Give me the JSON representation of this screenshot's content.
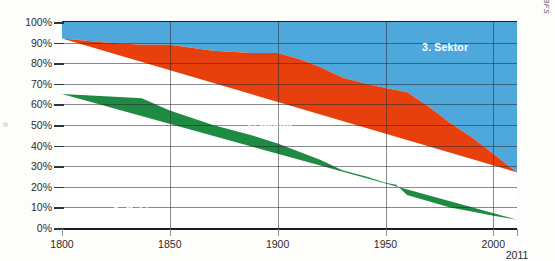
{
  "chart_data": {
    "type": "area",
    "stacked": "100-percent",
    "title": "",
    "subtitle": "",
    "xlabel": "",
    "ylabel": "",
    "xlim": [
      1800,
      2011
    ],
    "ylim": [
      0,
      100
    ],
    "grid": true,
    "legend_position": "inline",
    "source": "Quelle: BFS",
    "xticks": [
      1800,
      1850,
      1900,
      1950,
      2000
    ],
    "xtick_labels": [
      "1800",
      "1850",
      "1900",
      "1950",
      "2000"
    ],
    "x_end_label": "2011",
    "yticks": [
      0,
      10,
      20,
      30,
      40,
      50,
      60,
      70,
      80,
      90,
      100
    ],
    "ytick_labels": [
      "0%",
      "10%",
      "20%",
      "30%",
      "40%",
      "50%",
      "60%",
      "70%",
      "80%",
      "90%",
      "100%"
    ],
    "x": [
      1800,
      1820,
      1837,
      1850,
      1870,
      1888,
      1900,
      1910,
      1920,
      1930,
      1941,
      1950,
      1955,
      1960,
      1970,
      1980,
      1990,
      2000,
      2011
    ],
    "series": [
      {
        "name": "1. Sektor",
        "color": "#1e8a42",
        "values": [
          65,
          64,
          63,
          57,
          50,
          45,
          41,
          37,
          33,
          28,
          25,
          22,
          21,
          16,
          13,
          10,
          8,
          6,
          4
        ]
      },
      {
        "name": "2. Sektor",
        "color": "#e8400c",
        "values": [
          27,
          26,
          26,
          32,
          36,
          40,
          44,
          45,
          45,
          45,
          45,
          46,
          46,
          50,
          46,
          41,
          36,
          30,
          23
        ]
      },
      {
        "name": "3. Sektor",
        "color": "#4fa8dc",
        "values": [
          8,
          10,
          11,
          11,
          14,
          15,
          15,
          18,
          22,
          27,
          30,
          32,
          33,
          34,
          41,
          49,
          56,
          64,
          73
        ]
      }
    ],
    "cumulative_upper_bounds": {
      "sector1_top": [
        65,
        64,
        63,
        57,
        50,
        45,
        41,
        37,
        33,
        28,
        25,
        22,
        21,
        16,
        13,
        10,
        8,
        6,
        4
      ],
      "sector2_top": [
        92,
        90,
        89,
        89,
        86,
        85,
        85,
        82,
        78,
        73,
        70,
        68,
        67,
        66,
        59,
        51,
        44,
        36,
        27
      ]
    },
    "annotations": [
      {
        "text": "1. Sektor",
        "x": 1824,
        "y": 9
      },
      {
        "text": "2. Sektor",
        "x": 1886,
        "y": 51
      },
      {
        "text": "3. Sektor",
        "x": 1967,
        "y": 88
      }
    ]
  },
  "axis": {
    "y_labels": [
      "100%",
      "90%",
      "80%",
      "70%",
      "60%",
      "50%",
      "40%",
      "30%",
      "20%",
      "10%",
      "0%"
    ],
    "x_labels": [
      "1800",
      "1850",
      "1900",
      "1950",
      "2000"
    ],
    "x_end_label": "2011"
  },
  "labels": {
    "sector1": "1. Sektor",
    "sector2": "2. Sektor",
    "sector3": "3. Sektor"
  },
  "source": {
    "text": "Quelle: BFS"
  },
  "colors": {
    "sector1": "#1e8a42",
    "sector2": "#e8400c",
    "sector3": "#4fa8dc",
    "frame": "#1b1b2b",
    "grid": "#28282f"
  }
}
